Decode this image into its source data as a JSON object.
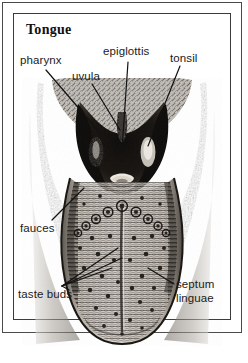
{
  "plate": {
    "title": "Tongue",
    "frame_color": "#3a3a3a",
    "background": "#ffffff",
    "ink_color": "#1b1b1b"
  },
  "labels": [
    {
      "id": "pharynx",
      "text": "pharynx",
      "x": 20,
      "y": 54
    },
    {
      "id": "uvula",
      "text": "uvula",
      "x": 72,
      "y": 70
    },
    {
      "id": "epiglottis",
      "text": "epiglottis",
      "x": 103,
      "y": 45
    },
    {
      "id": "tonsil",
      "text": "tonsil",
      "x": 170,
      "y": 52
    },
    {
      "id": "fauces",
      "text": "fauces",
      "x": 20,
      "y": 222
    },
    {
      "id": "taste-buds",
      "text": "taste buds",
      "x": 18,
      "y": 288
    },
    {
      "id": "septum-linguae",
      "text_line1": "septum",
      "text_line2": "linguae",
      "x": 176,
      "y": 277
    }
  ],
  "illustration": {
    "subject": "human tongue, oral cavity and pharynx, anterior view",
    "style": "engraving halftone",
    "features": [
      "pharyngeal arches",
      "uvula",
      "epiglottis",
      "palatine tonsils",
      "fauces",
      "circumvallate papillae in V formation",
      "fungiform papillae",
      "median sulcus / septum linguae",
      "tongue tip extending past lower frame"
    ]
  }
}
